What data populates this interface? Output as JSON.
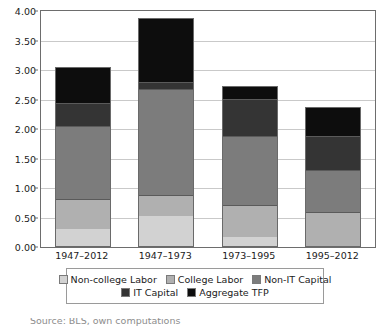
{
  "chart_data": {
    "type": "bar",
    "stacked": true,
    "title": "",
    "subtitle": "",
    "xlabel": "",
    "ylabel": "",
    "categories": [
      "1947–2012",
      "1947–1973",
      "1973–1995",
      "1995–2012"
    ],
    "ylim": [
      0.0,
      4.0
    ],
    "ytick_labels": [
      "0.00",
      "0.50",
      "1.00",
      "1.50",
      "2.00",
      "2.50",
      "3.00",
      "3.50",
      "4.00"
    ],
    "ytick_values": [
      0.0,
      0.5,
      1.0,
      1.5,
      2.0,
      2.5,
      3.0,
      3.5,
      4.0
    ],
    "grid": true,
    "legend_position": "bottom",
    "series": [
      {
        "name": "Non-college Labor",
        "color": "#d2d2d2",
        "values": [
          0.31,
          0.52,
          0.17,
          0.0
        ]
      },
      {
        "name": "College Labor",
        "color": "#b0b0b0",
        "values": [
          0.5,
          0.36,
          0.55,
          0.6
        ]
      },
      {
        "name": "Non-IT Capital",
        "color": "#7c7c7c",
        "values": [
          1.24,
          1.79,
          1.16,
          0.7
        ]
      },
      {
        "name": "IT Capital",
        "color": "#343434",
        "values": [
          0.39,
          0.13,
          0.63,
          0.58
        ]
      },
      {
        "name": "Aggregate TFP",
        "color": "#0d0d0d",
        "values": [
          0.61,
          1.09,
          0.22,
          0.49
        ]
      }
    ],
    "totals": [
      3.05,
      3.89,
      2.73,
      2.37
    ]
  },
  "legend": {
    "rows": [
      [
        "Non-college Labor",
        "College Labor",
        "Non-IT Capital"
      ],
      [
        "IT Capital",
        "Aggregate TFP"
      ]
    ]
  },
  "caption": {
    "clipped_text": "Source: BLS, own computations"
  }
}
